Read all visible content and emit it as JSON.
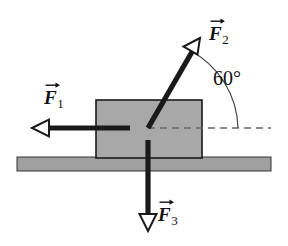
{
  "diagram": {
    "type": "physics-free-body-diagram",
    "colors": {
      "block_fill": "#a8a8a8",
      "block_stroke": "#1a1a1a",
      "ground_fill": "#a0a0a0",
      "ground_stroke": "#1a1a1a",
      "arrow_stroke": "#1a1a1a",
      "dashed_line": "#666666",
      "arc_stroke": "#333333",
      "text": "#111111",
      "background": "#ffffff"
    },
    "block": {
      "x": 96,
      "y": 100,
      "width": 106,
      "height": 58
    },
    "ground": {
      "x": 17,
      "y": 157,
      "width": 254,
      "height": 14
    },
    "pivot": {
      "x": 148,
      "y": 128
    },
    "dashed_reference_line": {
      "x1": 148,
      "y1": 128,
      "x2": 271,
      "y2": 128
    },
    "angle": {
      "value": "60°",
      "degrees": 60,
      "from": "horizontal-dashed-line",
      "to": "F2",
      "label_x": 213,
      "label_y": 68
    },
    "forces": [
      {
        "id": "F1",
        "label": "F",
        "subscript": "1",
        "direction": "left",
        "angle_deg": 180,
        "tail": {
          "x": 130,
          "y": 128
        },
        "tip": {
          "x": 32,
          "y": 128
        },
        "label_x": 44,
        "label_y": 88,
        "arrowhead": "open"
      },
      {
        "id": "F2",
        "label": "F",
        "subscript": "2",
        "direction": "up-right",
        "angle_deg": 60,
        "tail": {
          "x": 148,
          "y": 128
        },
        "tip": {
          "x": 200,
          "y": 38
        },
        "label_x": 209,
        "label_y": 24,
        "arrowhead": "open"
      },
      {
        "id": "F3",
        "label": "F",
        "subscript": "3",
        "direction": "down",
        "angle_deg": 270,
        "tail": {
          "x": 148,
          "y": 140
        },
        "tip": {
          "x": 148,
          "y": 231
        },
        "label_x": 158,
        "label_y": 205,
        "arrowhead": "open"
      }
    ]
  }
}
